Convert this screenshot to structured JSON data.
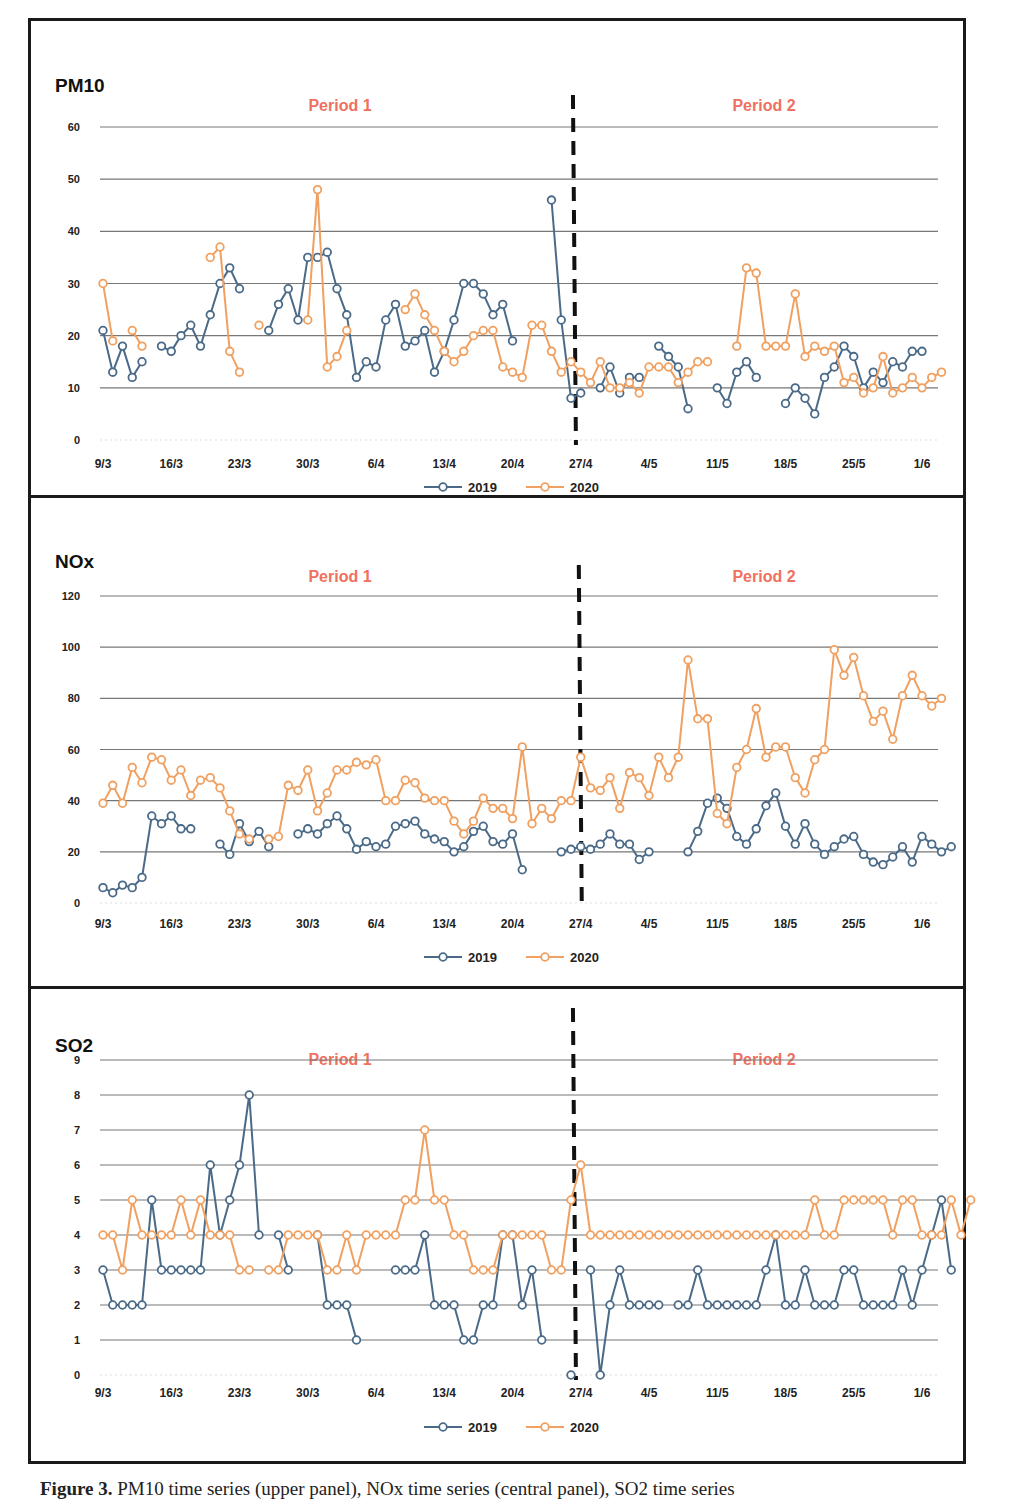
{
  "colors": {
    "series_2019": "#4a6a88",
    "series_2020": "#f0a060",
    "period_label": "#f07060",
    "gridline": "#777777",
    "divider": "#111111",
    "axis_text": "#222222"
  },
  "legend": {
    "series": [
      "2019",
      "2020"
    ]
  },
  "caption": {
    "label": "Figure 3.",
    "text": "PM10 time series (upper panel), NOx time series (central panel), SO2 time series"
  },
  "chart_data": [
    {
      "type": "line",
      "title": "PM10",
      "period_labels": [
        "Period 1",
        "Period 2"
      ],
      "xlabel": "",
      "ylabel": "",
      "ylim": [
        0,
        60
      ],
      "yticks": [
        0,
        10,
        20,
        30,
        40,
        50,
        60
      ],
      "xtick_labels": [
        "9/3",
        "16/3",
        "23/3",
        "30/3",
        "6/4",
        "13/4",
        "20/4",
        "27/4",
        "4/5",
        "11/5",
        "18/5",
        "25/5",
        "1/6"
      ],
      "xtick_days": [
        0,
        7,
        14,
        21,
        28,
        35,
        42,
        49,
        56,
        63,
        70,
        77,
        84
      ],
      "divider_day": 48.2,
      "grid": true,
      "legend_position": "bottom",
      "x_start_date": "9/3",
      "series": [
        {
          "name": "2019",
          "values": [
            21,
            13,
            18,
            12,
            15,
            null,
            18,
            17,
            20,
            22,
            18,
            24,
            30,
            33,
            29,
            null,
            null,
            21,
            26,
            29,
            23,
            35,
            35,
            36,
            29,
            24,
            12,
            15,
            14,
            23,
            26,
            18,
            19,
            21,
            13,
            17,
            23,
            30,
            30,
            28,
            24,
            26,
            19,
            null,
            null,
            null,
            46,
            23,
            8,
            9,
            null,
            10,
            14,
            9,
            12,
            12,
            null,
            18,
            16,
            14,
            6,
            null,
            null,
            10,
            7,
            13,
            15,
            12,
            null,
            null,
            7,
            10,
            8,
            5,
            12,
            14,
            18,
            16,
            10,
            13,
            11,
            15,
            14,
            17,
            17,
            null,
            null
          ]
        },
        {
          "name": "2020",
          "values": [
            30,
            19,
            null,
            21,
            18,
            null,
            null,
            null,
            null,
            null,
            null,
            35,
            37,
            17,
            13,
            null,
            22,
            null,
            null,
            null,
            null,
            23,
            48,
            14,
            16,
            21,
            null,
            null,
            null,
            null,
            null,
            25,
            28,
            24,
            21,
            17,
            15,
            17,
            20,
            21,
            21,
            14,
            13,
            12,
            22,
            22,
            17,
            13,
            15,
            13,
            11,
            15,
            10,
            10,
            11,
            9,
            14,
            14,
            14,
            11,
            13,
            15,
            15,
            null,
            null,
            18,
            33,
            32,
            18,
            18,
            18,
            28,
            16,
            18,
            17,
            18,
            11,
            12,
            9,
            10,
            16,
            9,
            10,
            12,
            10,
            12,
            13
          ]
        }
      ]
    },
    {
      "type": "line",
      "title": "NOx",
      "period_labels": [
        "Period 1",
        "Period 2"
      ],
      "xlabel": "",
      "ylabel": "",
      "ylim": [
        0,
        120
      ],
      "yticks": [
        0,
        20,
        40,
        60,
        80,
        100,
        120
      ],
      "xtick_labels": [
        "9/3",
        "16/3",
        "23/3",
        "30/3",
        "6/4",
        "13/4",
        "20/4",
        "27/4",
        "4/5",
        "11/5",
        "18/5",
        "25/5",
        "1/6"
      ],
      "xtick_days": [
        0,
        7,
        14,
        21,
        28,
        35,
        42,
        49,
        56,
        63,
        70,
        77,
        84
      ],
      "divider_day": 48.8,
      "grid": true,
      "legend_position": "bottom",
      "x_start_date": "9/3",
      "series": [
        {
          "name": "2019",
          "values": [
            6,
            4,
            7,
            6,
            10,
            34,
            31,
            34,
            29,
            29,
            null,
            null,
            23,
            19,
            31,
            24,
            28,
            22,
            null,
            null,
            27,
            29,
            27,
            31,
            34,
            29,
            21,
            24,
            22,
            23,
            30,
            31,
            32,
            27,
            25,
            24,
            20,
            22,
            28,
            30,
            24,
            23,
            27,
            13,
            null,
            null,
            null,
            20,
            21,
            22,
            21,
            23,
            27,
            23,
            23,
            17,
            20,
            null,
            null,
            null,
            20,
            28,
            39,
            41,
            37,
            26,
            23,
            29,
            38,
            43,
            30,
            23,
            31,
            23,
            19,
            22,
            25,
            26,
            19,
            16,
            15,
            18,
            22,
            16,
            26,
            23,
            20,
            22
          ]
        },
        {
          "name": "2020",
          "values": [
            39,
            46,
            39,
            53,
            47,
            57,
            56,
            48,
            52,
            42,
            48,
            49,
            45,
            36,
            27,
            25,
            null,
            25,
            26,
            46,
            44,
            52,
            36,
            43,
            52,
            52,
            55,
            54,
            56,
            40,
            40,
            48,
            47,
            41,
            40,
            40,
            32,
            27,
            32,
            41,
            37,
            37,
            33,
            61,
            31,
            37,
            33,
            40,
            40,
            57,
            45,
            44,
            49,
            37,
            51,
            49,
            42,
            57,
            49,
            57,
            95,
            72,
            72,
            35,
            31,
            53,
            60,
            76,
            57,
            61,
            61,
            49,
            43,
            56,
            60,
            99,
            89,
            96,
            81,
            71,
            75,
            64,
            81,
            89,
            81,
            77,
            80
          ]
        }
      ]
    },
    {
      "type": "line",
      "title": "SO2",
      "period_labels": [
        "Period 1",
        "Period 2"
      ],
      "xlabel": "",
      "ylabel": "",
      "ylim": [
        0,
        9
      ],
      "yticks": [
        0,
        1,
        2,
        3,
        4,
        5,
        6,
        7,
        8,
        9
      ],
      "xtick_labels": [
        "9/3",
        "16/3",
        "23/3",
        "30/3",
        "6/4",
        "13/4",
        "20/4",
        "27/4",
        "4/5",
        "11/5",
        "18/5",
        "25/5",
        "1/6"
      ],
      "xtick_days": [
        0,
        7,
        14,
        21,
        28,
        35,
        42,
        49,
        56,
        63,
        70,
        77,
        84
      ],
      "divider_day": 48.2,
      "grid": true,
      "legend_position": "bottom",
      "x_start_date": "9/3",
      "series": [
        {
          "name": "2019",
          "values": [
            3,
            2,
            2,
            2,
            2,
            5,
            3,
            3,
            3,
            3,
            3,
            6,
            4,
            5,
            6,
            8,
            4,
            null,
            4,
            3,
            null,
            null,
            4,
            2,
            2,
            2,
            1,
            null,
            null,
            null,
            3,
            3,
            3,
            4,
            2,
            2,
            2,
            1,
            1,
            2,
            2,
            4,
            4,
            2,
            3,
            1,
            null,
            null,
            0,
            null,
            3,
            0,
            2,
            3,
            2,
            2,
            2,
            2,
            null,
            2,
            2,
            3,
            2,
            2,
            2,
            2,
            2,
            2,
            3,
            4,
            2,
            2,
            3,
            2,
            2,
            2,
            3,
            3,
            2,
            2,
            2,
            2,
            3,
            2,
            3,
            4,
            5,
            3
          ]
        },
        {
          "name": "2020",
          "values": [
            4,
            4,
            3,
            5,
            4,
            4,
            4,
            4,
            5,
            4,
            5,
            4,
            4,
            4,
            3,
            3,
            null,
            3,
            3,
            4,
            4,
            4,
            4,
            3,
            3,
            4,
            3,
            4,
            4,
            4,
            4,
            5,
            5,
            7,
            5,
            5,
            4,
            4,
            3,
            3,
            3,
            4,
            4,
            4,
            4,
            4,
            3,
            3,
            5,
            6,
            4,
            4,
            4,
            4,
            4,
            4,
            4,
            4,
            4,
            4,
            4,
            4,
            4,
            4,
            4,
            4,
            4,
            4,
            4,
            4,
            4,
            4,
            4,
            5,
            4,
            4,
            5,
            5,
            5,
            5,
            5,
            4,
            5,
            5,
            4,
            4,
            4,
            5,
            4,
            5
          ]
        }
      ]
    }
  ]
}
